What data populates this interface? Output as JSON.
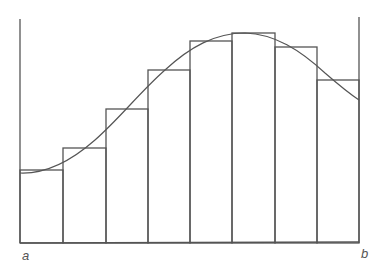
{
  "diagram": {
    "title": "",
    "labels": {
      "left": "a",
      "right": "b"
    },
    "colors": {
      "stroke": "#555555",
      "background": "#ffffff"
    }
  },
  "chart_data": {
    "type": "bar",
    "title": "",
    "xlabel": "",
    "ylabel": "",
    "categories": [
      "1",
      "2",
      "3",
      "4",
      "5",
      "6",
      "7",
      "8"
    ],
    "values": [
      73,
      95,
      134,
      173,
      202,
      210,
      196,
      163
    ],
    "x_tick_labels": [
      "a",
      "b"
    ],
    "overlay_curve": "smooth bell-like curve rising from left, peaking near bar 6, descending to the right",
    "grid": false,
    "legend": null
  }
}
